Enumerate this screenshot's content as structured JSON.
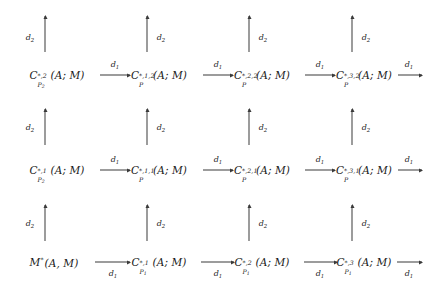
{
  "diagram": {
    "type": "commutative-diagram",
    "rows": 3,
    "columns": 4,
    "horizontal_map_label": "d",
    "horizontal_map_index": "1",
    "vertical_map_label": "d",
    "vertical_map_index": "2",
    "arrow_color": "#3a3a3a",
    "text_color": "#1a1a1a",
    "background": "#ffffff",
    "objects": {
      "r0c0": {
        "base": "C",
        "sup": "*,2",
        "sub": "P",
        "subsub": "2",
        "args": "(A; M)",
        "plain": "C^{*,2}_{P_2}(A;M)"
      },
      "r0c1": {
        "base": "C",
        "sup": "*,1,2",
        "sub": "P",
        "subsub": "",
        "args": "(A; M)",
        "plain": "C^{*,1,2}_{P}(A;M)"
      },
      "r0c2": {
        "base": "C",
        "sup": "*,2,2",
        "sub": "P",
        "subsub": "",
        "args": "(A; M)",
        "plain": "C^{*,2,2}_{P}(A;M)"
      },
      "r0c3": {
        "base": "C",
        "sup": "*,3,2",
        "sub": "P",
        "subsub": "",
        "args": "(A; M)",
        "plain": "C^{*,3,2}_{P}(A;M)"
      },
      "r1c0": {
        "base": "C",
        "sup": "*,1",
        "sub": "P",
        "subsub": "2",
        "args": "(A; M)",
        "plain": "C^{*,1}_{P_2}(A;M)"
      },
      "r1c1": {
        "base": "C",
        "sup": "*,1,1",
        "sub": "P",
        "subsub": "",
        "args": "(A; M)",
        "plain": "C^{*,1,1}_{P}(A;M)"
      },
      "r1c2": {
        "base": "C",
        "sup": "*,2,1",
        "sub": "P",
        "subsub": "",
        "args": "(A; M)",
        "plain": "C^{*,2,1}_{P}(A;M)"
      },
      "r1c3": {
        "base": "C",
        "sup": "*,3,1",
        "sub": "P",
        "subsub": "",
        "args": "(A; M)",
        "plain": "C^{*,3,1}_{P}(A;M)"
      },
      "r2c0": {
        "base": "M",
        "sup": "*",
        "sub": "",
        "subsub": "",
        "args": "(A, M)",
        "plain": "M^{*}(A,M)"
      },
      "r2c1": {
        "base": "C",
        "sup": "*,1",
        "sub": "P",
        "subsub": "1",
        "args": "(A; M)",
        "plain": "C^{*,1}_{P_1}(A;M)"
      },
      "r2c2": {
        "base": "C",
        "sup": "*,2",
        "sub": "P",
        "subsub": "1",
        "args": "(A; M)",
        "plain": "C^{*,2}_{P_1}(A;M)"
      },
      "r2c3": {
        "base": "C",
        "sup": "*,3",
        "sub": "P",
        "subsub": "1",
        "args": "(A; M)",
        "plain": "C^{*,3}_{P_1}(A;M)"
      }
    },
    "horizontal_arrows": [
      {
        "id": "h-r0-c0c1",
        "label": "d",
        "index": "1",
        "row": 0,
        "from": "r0c0",
        "to": "r0c1"
      },
      {
        "id": "h-r0-c1c2",
        "label": "d",
        "index": "1",
        "row": 0,
        "from": "r0c1",
        "to": "r0c2"
      },
      {
        "id": "h-r0-c2c3",
        "label": "d",
        "index": "1",
        "row": 0,
        "from": "r0c2",
        "to": "r0c3"
      },
      {
        "id": "h-r0-c3out",
        "label": "d",
        "index": "1",
        "row": 0,
        "from": "r0c3",
        "to": ""
      },
      {
        "id": "h-r1-c0c1",
        "label": "d",
        "index": "1",
        "row": 1,
        "from": "r1c0",
        "to": "r1c1"
      },
      {
        "id": "h-r1-c1c2",
        "label": "d",
        "index": "1",
        "row": 1,
        "from": "r1c1",
        "to": "r1c2"
      },
      {
        "id": "h-r1-c2c3",
        "label": "d",
        "index": "1",
        "row": 1,
        "from": "r1c2",
        "to": "r1c3"
      },
      {
        "id": "h-r1-c3out",
        "label": "d",
        "index": "1",
        "row": 1,
        "from": "r1c3",
        "to": ""
      },
      {
        "id": "h-r2-c0c1",
        "label": "d",
        "index": "1",
        "row": 2,
        "from": "r2c0",
        "to": "r2c1"
      },
      {
        "id": "h-r2-c1c2",
        "label": "d",
        "index": "1",
        "row": 2,
        "from": "r2c1",
        "to": "r2c2"
      },
      {
        "id": "h-r2-c2c3",
        "label": "d",
        "index": "1",
        "row": 2,
        "from": "r2c2",
        "to": "r2c3"
      },
      {
        "id": "h-r2-c3out",
        "label": "d",
        "index": "1",
        "row": 2,
        "from": "r2c3",
        "to": ""
      }
    ],
    "vertical_arrows": [
      {
        "id": "v-c0-top",
        "label": "d",
        "index": "2",
        "column": 0
      },
      {
        "id": "v-c1-top",
        "label": "d",
        "index": "2",
        "column": 1
      },
      {
        "id": "v-c2-top",
        "label": "d",
        "index": "2",
        "column": 2
      },
      {
        "id": "v-c3-top",
        "label": "d",
        "index": "2",
        "column": 3
      },
      {
        "id": "v-c0-mid",
        "label": "d",
        "index": "2",
        "column": 0
      },
      {
        "id": "v-c1-mid",
        "label": "d",
        "index": "2",
        "column": 1
      },
      {
        "id": "v-c2-mid",
        "label": "d",
        "index": "2",
        "column": 2
      },
      {
        "id": "v-c3-mid",
        "label": "d",
        "index": "2",
        "column": 3
      },
      {
        "id": "v-c0-bot",
        "label": "d",
        "index": "2",
        "column": 0
      },
      {
        "id": "v-c1-bot",
        "label": "d",
        "index": "2",
        "column": 1
      },
      {
        "id": "v-c2-bot",
        "label": "d",
        "index": "2",
        "column": 2
      },
      {
        "id": "v-c3-bot",
        "label": "d",
        "index": "2",
        "column": 3
      }
    ]
  }
}
